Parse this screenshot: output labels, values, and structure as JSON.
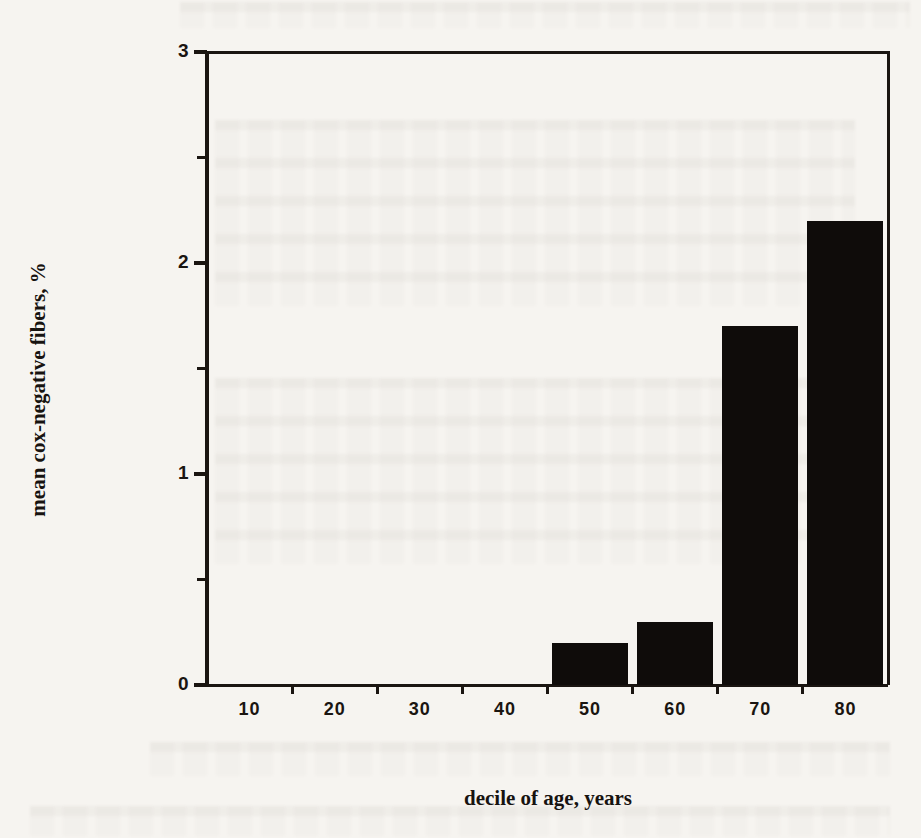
{
  "chart_data": {
    "type": "bar",
    "categories": [
      "10",
      "20",
      "30",
      "40",
      "50",
      "60",
      "70",
      "80"
    ],
    "values": [
      0,
      0,
      0,
      0,
      0.2,
      0.3,
      1.7,
      2.2
    ],
    "title": "",
    "xlabel": "decile of age, years",
    "ylabel": "mean cox-negative fibers, %",
    "ylim": [
      0,
      3
    ],
    "y_major_ticks": [
      0,
      1,
      2,
      3
    ],
    "y_minor_ticks": [
      0.5,
      1.5,
      2.5
    ],
    "grid": false,
    "legend": null,
    "frame": "box",
    "bar_color": "#0f0c0a",
    "axis_color": "#1a1511",
    "background_color": "#f6f4f0"
  }
}
